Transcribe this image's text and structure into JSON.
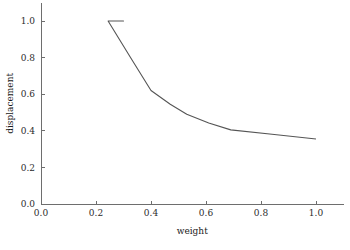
{
  "chart_data": {
    "type": "line",
    "title": "",
    "subtitle": "",
    "xlabel": "weight",
    "ylabel": "displacement",
    "xlim": [
      0.0,
      1.1
    ],
    "ylim": [
      0.0,
      1.1
    ],
    "grid": false,
    "legend": null,
    "x_ticks": [
      0.0,
      0.2,
      0.4,
      0.6,
      0.8,
      1.0
    ],
    "y_ticks": [
      0.0,
      0.2,
      0.4,
      0.6,
      0.8,
      1.0
    ],
    "x_tick_labels": [
      "0.0",
      "0.2",
      "0.4",
      "0.6",
      "0.8",
      "1.0"
    ],
    "y_tick_labels": [
      "0.0",
      "0.2",
      "0.4",
      "0.6",
      "0.8",
      "1.0"
    ],
    "series": [
      {
        "name": "displacement",
        "color": "#555555",
        "x": [
          0.244,
          0.3,
          0.244,
          0.33,
          0.4,
          0.47,
          0.53,
          0.61,
          0.69,
          0.84,
          1.0
        ],
        "y": [
          1.0,
          1.0,
          1.0,
          0.79,
          0.62,
          0.545,
          0.49,
          0.443,
          0.405,
          0.381,
          0.355
        ]
      }
    ]
  },
  "axes": {
    "x_axis_label": "weight",
    "y_axis_label": "displacement"
  }
}
